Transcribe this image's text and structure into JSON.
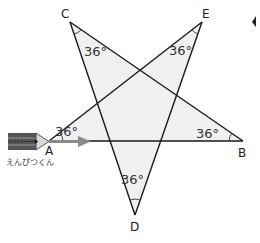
{
  "figure": {
    "vertices": {
      "A": {
        "label": "A",
        "x": 49,
        "y": 141
      },
      "B": {
        "label": "B",
        "x": 243,
        "y": 141
      },
      "C": {
        "label": "C",
        "x": 70,
        "y": 22
      },
      "D": {
        "label": "D",
        "x": 135,
        "y": 215
      },
      "E": {
        "label": "E",
        "x": 202,
        "y": 22
      }
    },
    "angles": {
      "A": "36°",
      "B": "36°",
      "C": "36°",
      "D": "36°",
      "E": "36°"
    },
    "pencil_caption": "えんぴつくん",
    "colors": {
      "line": "#1a1a1a",
      "fill": "#f0f0f0",
      "arrow": "#8a8a8a",
      "pencil_body": "#555555"
    }
  }
}
